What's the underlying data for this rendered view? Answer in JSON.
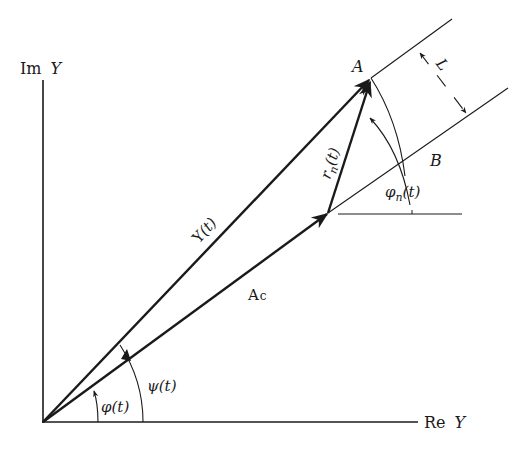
{
  "diagram": {
    "colors": {
      "ink": "#1a1a1a",
      "background": "#ffffff"
    },
    "axes": {
      "imag_label_prefix": "Im",
      "imag_label_var": "Y",
      "real_label_prefix": "Re",
      "real_label_var": "Y"
    },
    "vectors": {
      "resultant": {
        "name": "Y",
        "arg": "(t)"
      },
      "carrier": {
        "name": "A",
        "subscript": "c"
      },
      "noise": {
        "name": "r",
        "subscript": "n",
        "arg": "(t)"
      }
    },
    "angles": {
      "phi": {
        "symbol": "φ",
        "arg": "(t)"
      },
      "psi": {
        "symbol": "ψ",
        "arg": "(t)"
      },
      "phi_n": {
        "symbol": "φ",
        "subscript": "n",
        "arg": "(t)"
      }
    },
    "points": {
      "A": "A",
      "B": "B"
    },
    "dimension": {
      "L": "L"
    }
  }
}
